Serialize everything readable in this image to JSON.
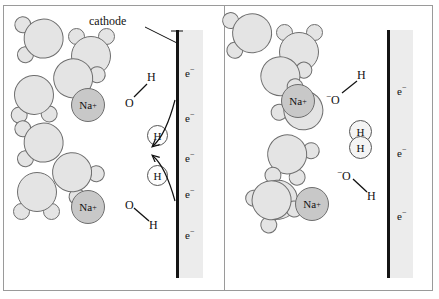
{
  "figure": {
    "caption_label": "cathode",
    "colors": {
      "water_fill": "#e4e4e4",
      "water_stroke": "#6e6e6e",
      "sodium_fill": "#c8c8c8",
      "electrode": "#141414",
      "electrode_strip": "#ececec",
      "frame": "#9a9a9a"
    }
  },
  "left_panel": {
    "name": "before-reduction",
    "electron_labels": [
      "e",
      "e",
      "e",
      "e",
      "e"
    ],
    "electron_charge": "−",
    "sodium_ions": [
      {
        "label": "Na",
        "charge": "+"
      },
      {
        "label": "Na",
        "charge": "+"
      }
    ],
    "water_molecules_count": 8,
    "oriented_water": [
      {
        "oxygen": "O",
        "hydrogen": "H",
        "state": "intact-losing-H"
      },
      {
        "oxygen": "O",
        "hydrogen": "H",
        "state": "intact-losing-H"
      }
    ],
    "free_hydrogens": [
      {
        "label": "H"
      },
      {
        "label": "H"
      }
    ],
    "oxygen_label": "O",
    "hydrogen_label": "H",
    "arrow_count": 2,
    "arrow_meaning": "electron-transfer-to-hydrogen"
  },
  "right_panel": {
    "name": "after-reduction",
    "electron_labels": [
      "e",
      "e",
      "e"
    ],
    "electron_charge": "−",
    "sodium_ions": [
      {
        "label": "Na",
        "charge": "+"
      },
      {
        "label": "Na",
        "charge": "+"
      }
    ],
    "water_molecules_count": 8,
    "hydroxide_ions": [
      {
        "charge": "−",
        "oxygen": "O",
        "hydrogen": "H"
      },
      {
        "charge": "−",
        "oxygen": "O",
        "hydrogen": "H"
      }
    ],
    "hydrogen_molecule": {
      "top": "H",
      "bottom": "H"
    },
    "oxygen_label": "O",
    "hydrogen_label": "H"
  }
}
